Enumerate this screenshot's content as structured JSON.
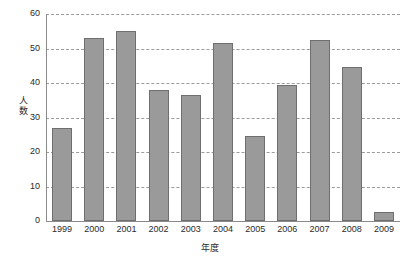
{
  "chart_data": {
    "type": "bar",
    "title": "",
    "subtitle": "",
    "xlabel": "年度",
    "ylabel": "人数",
    "categories": [
      "1999",
      "2000",
      "2001",
      "2002",
      "2003",
      "2004",
      "2005",
      "2006",
      "2007",
      "2008",
      "2009"
    ],
    "values": [
      27,
      53,
      55,
      38,
      36.5,
      51.5,
      24.5,
      39.5,
      52.5,
      44.5,
      2.5
    ],
    "series": [
      {
        "name": "人数",
        "values": [
          27,
          53,
          55,
          38,
          36.5,
          51.5,
          24.5,
          39.5,
          52.5,
          44.5,
          2.5
        ]
      }
    ],
    "ylim": [
      0,
      60
    ],
    "ytick_labels": [
      "0",
      "10",
      "20",
      "30",
      "40",
      "50",
      "60"
    ],
    "ytick_values": [
      0,
      10,
      20,
      30,
      40,
      50,
      60
    ],
    "grid": true,
    "grid_axis": "y",
    "grid_style": "dashed",
    "legend": false,
    "legend_position": "none",
    "bar_color": "#9a9a9a",
    "bar_border_color": "#6f6f6f",
    "grid_color": "#9b9b9b",
    "axis_color": "#8a8a8a",
    "text_color": "#2b2b2b",
    "background": "#ffffff"
  },
  "axis": {
    "y_title_chars": [
      "人",
      "数"
    ]
  }
}
